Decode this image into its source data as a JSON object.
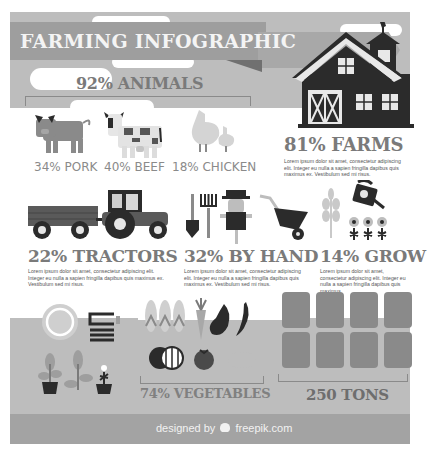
{
  "title": "FARMING INFOGRAPHIC",
  "colors": {
    "panel_gray": "#bdbdbd",
    "banner_gray": "#9e9e9e",
    "dark": "#2b2b2b",
    "text_gray": "#7a7a7a",
    "ground_gray": "#a3a3a3"
  },
  "animals": {
    "heading": "92% ANIMALS",
    "items": [
      {
        "label": "34% PORK",
        "icon": "pig-icon"
      },
      {
        "label": "40% BEEF",
        "icon": "cow-icon"
      },
      {
        "label": "18% CHICKEN",
        "icon": "chicken-icon"
      }
    ]
  },
  "farms": {
    "heading": "81% FARMS",
    "text": "Lorem ipsum dolor sit amet, consectetur adipiscing elit. Integer eu nulla a sapien fringilla dapibus quis maximus ex. Vestibulum sed mi risus."
  },
  "tractors": {
    "heading": "22% TRACTORS",
    "text": "Lorem ipsum dolor sit amet, consectetur adipiscing elit. Integer eu nulla a sapien fringilla dapibus quis maximus ex. Vestibulum sed mi risus."
  },
  "by_hand": {
    "heading": "32% BY HAND",
    "text": "Lorem ipsum dolor sit amet, consectetur adipiscing elit. Integer eu nulla a sapien fringilla dapibus quis maximus ex. Vestibulum sed mi risus."
  },
  "grow": {
    "heading": "14% GROW",
    "text": "Lorem ipsum dolor sit amet, consectetur adipiscing elit. Integer eu nulla a sapien fringilla dapibus quis maximus"
  },
  "vegetables": {
    "heading": "74% VEGETABLES"
  },
  "tons": {
    "heading": "250 TONS",
    "bag_count": 8
  },
  "footer": {
    "credit_prefix": "designed by",
    "credit_brand": "freepik.com"
  }
}
